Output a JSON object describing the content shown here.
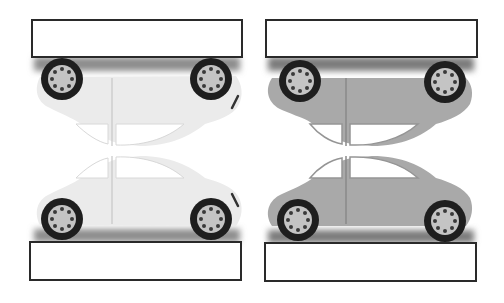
{
  "diagram": {
    "panels": [
      {
        "id": "left",
        "car_color": "#ebebeb",
        "car_outline": "#d6d6d6",
        "shadow_color": "#8a8a8a",
        "top_label": "",
        "bottom_label": ""
      },
      {
        "id": "right",
        "car_color": "#a9a9a9",
        "car_outline": "#959595",
        "shadow_color": "#7a7a7a",
        "top_label": "",
        "bottom_label": ""
      }
    ],
    "colors": {
      "box_border": "#2a2a2a",
      "tire": "#1e1e1e",
      "hub": "#c4c4c4",
      "bolt": "#3a3a3a",
      "window": "#ffffff"
    }
  }
}
